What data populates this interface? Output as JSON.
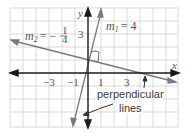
{
  "diagram": {
    "axes": {
      "x_label": "x",
      "y_label": "y",
      "x_ticks": [
        {
          "value": -3,
          "label": "−3"
        },
        {
          "value": -1,
          "label": "−1"
        },
        {
          "value": 1,
          "label": "1"
        },
        {
          "value": 3,
          "label": "3"
        }
      ],
      "y_ticks": [
        {
          "value": 3,
          "label": "3"
        }
      ]
    },
    "lines": [
      {
        "name": "line-1",
        "slope_label_var": "m",
        "slope_label_sub": "1",
        "slope_label_eq": "= 4",
        "slope": 4,
        "y_intercept": 1
      },
      {
        "name": "line-2",
        "slope_label_var": "m",
        "slope_label_sub": "2",
        "slope_label_eq": "= −",
        "slope_num": "1",
        "slope_den": "4",
        "slope": -0.25,
        "y_intercept": 1
      }
    ],
    "annotation": {
      "line1": "perpendicular",
      "line2": "lines"
    },
    "right_angle_marker": true,
    "colors": {
      "grid": "#d9d9d9",
      "axis": "#1a1a1a",
      "line": "#7a7a7a",
      "text": "#3a3a3a"
    }
  }
}
